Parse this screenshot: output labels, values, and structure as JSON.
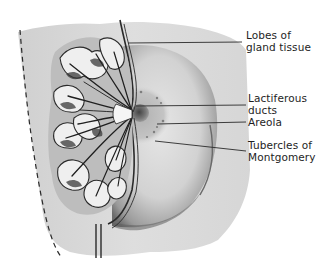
{
  "diagram": {
    "colors": {
      "background": "#ffffff",
      "skin_light": "#dcdcdc",
      "skin_mid": "#bdbdbd",
      "shadow": "#7a7a7a",
      "ink": "#1e1e1e",
      "areola": "#a8a8a8"
    },
    "labels": [
      {
        "id": "lobes",
        "line1": "Lobes of",
        "line2": "gland tissue"
      },
      {
        "id": "ducts",
        "line1": "Lactiferous",
        "line2": "ducts"
      },
      {
        "id": "areola",
        "line1": "Areola",
        "line2": ""
      },
      {
        "id": "tubercles",
        "line1": "Tubercles of",
        "line2": "Montgomery"
      }
    ]
  }
}
